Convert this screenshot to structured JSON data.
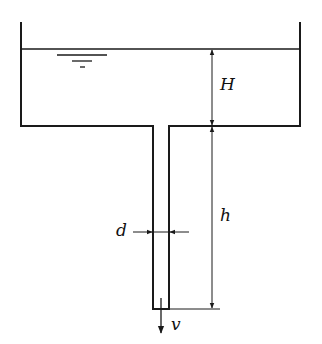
{
  "diagram": {
    "labels": {
      "H": "H",
      "h": "h",
      "d": "d",
      "v": "v"
    },
    "colors": {
      "line": "#1a1a1a",
      "background": "#ffffff"
    }
  }
}
